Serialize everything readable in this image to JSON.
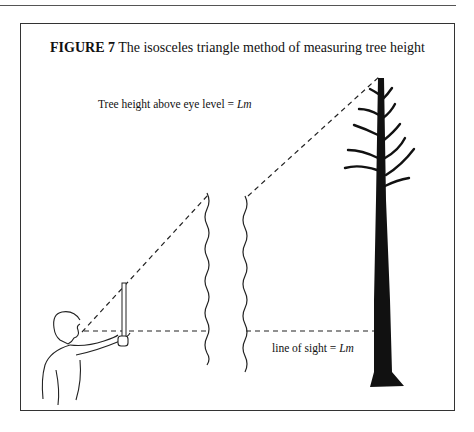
{
  "figure": {
    "label": "FIGURE 7",
    "title": "The isosceles triangle method of measuring tree height"
  },
  "annotations": {
    "tree_height": {
      "text": "Tree height above eye level = ",
      "var": "Lm"
    },
    "line_of_sight": {
      "text": "line of sight = ",
      "var": "Lm"
    }
  },
  "elements": [
    "observer",
    "measuring-stick",
    "tree",
    "sight-lines",
    "break-marks"
  ]
}
